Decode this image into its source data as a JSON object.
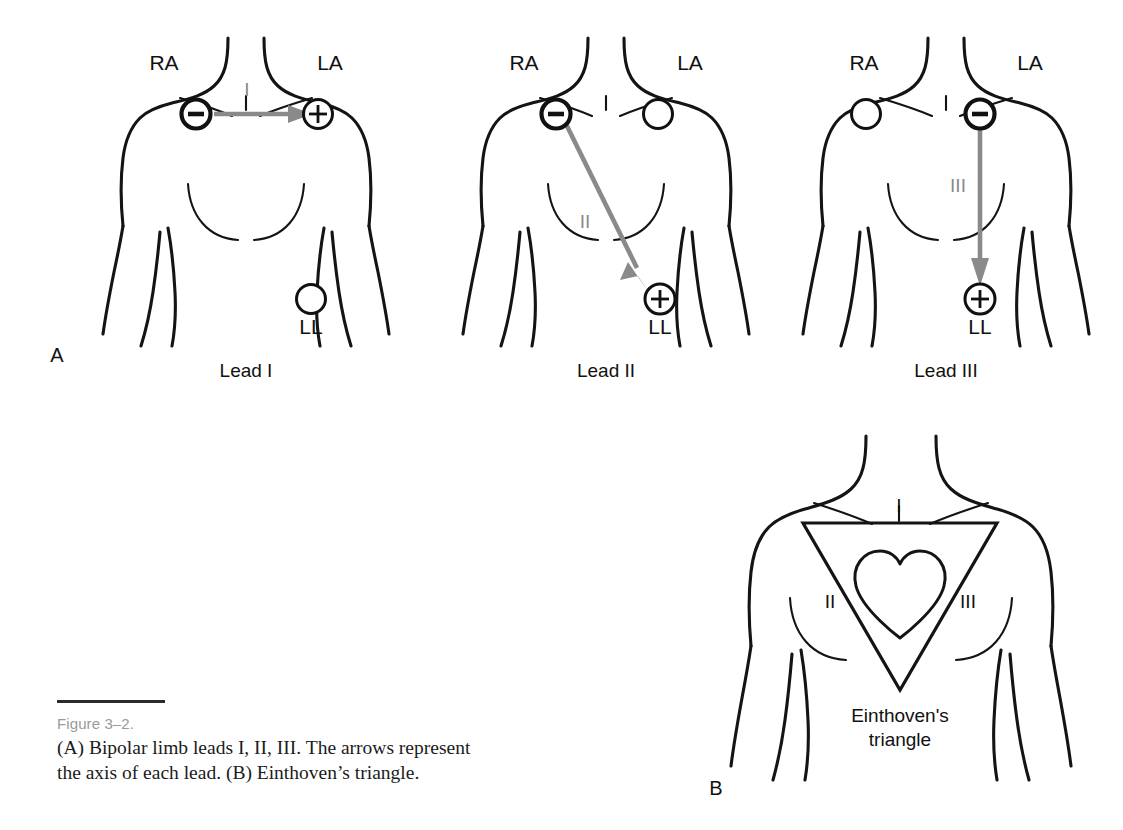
{
  "figure": {
    "number_label": "Figure 3–2.",
    "caption_line_1": "(A) Bipolar limb leads I, II, III. The arrows represent",
    "caption_line_2": "the axis of each lead. (B) Einthoven’s triangle.",
    "panel_a_letter": "A",
    "panel_b_letter": "B",
    "line_color": "#141414",
    "arrow_color": "#8a8a8a",
    "figno_color": "#9a9a9a"
  },
  "panel_a": {
    "leads": [
      {
        "caption": "Lead I",
        "axis_label": "I",
        "electrodes": {
          "right_arm": {
            "label": "RA",
            "polarity": "negative",
            "sign": "−"
          },
          "left_arm": {
            "label": "LA",
            "polarity": "positive",
            "sign": "+"
          },
          "left_leg": {
            "label": "LL",
            "polarity": "none",
            "sign": ""
          }
        },
        "arrow_from": "RA",
        "arrow_to": "LA",
        "arrow_direction": "horizontal-right"
      },
      {
        "caption": "Lead II",
        "axis_label": "II",
        "electrodes": {
          "right_arm": {
            "label": "RA",
            "polarity": "negative",
            "sign": "−"
          },
          "left_arm": {
            "label": "LA",
            "polarity": "none",
            "sign": ""
          },
          "left_leg": {
            "label": "LL",
            "polarity": "positive",
            "sign": "+"
          }
        },
        "arrow_from": "RA",
        "arrow_to": "LL",
        "arrow_direction": "diagonal-down-right"
      },
      {
        "caption": "Lead III",
        "axis_label": "III",
        "electrodes": {
          "right_arm": {
            "label": "RA",
            "polarity": "none",
            "sign": ""
          },
          "left_arm": {
            "label": "LA",
            "polarity": "negative",
            "sign": "−"
          },
          "left_leg": {
            "label": "LL",
            "polarity": "positive",
            "sign": "+"
          }
        },
        "arrow_from": "LA",
        "arrow_to": "LL",
        "arrow_direction": "vertical-down"
      }
    ]
  },
  "panel_b": {
    "triangle_label_top": "I",
    "triangle_label_left": "II",
    "triangle_label_right": "III",
    "annotation_line_1": "Einthoven's",
    "annotation_line_2": "triangle",
    "center_icon": "heart-icon"
  }
}
